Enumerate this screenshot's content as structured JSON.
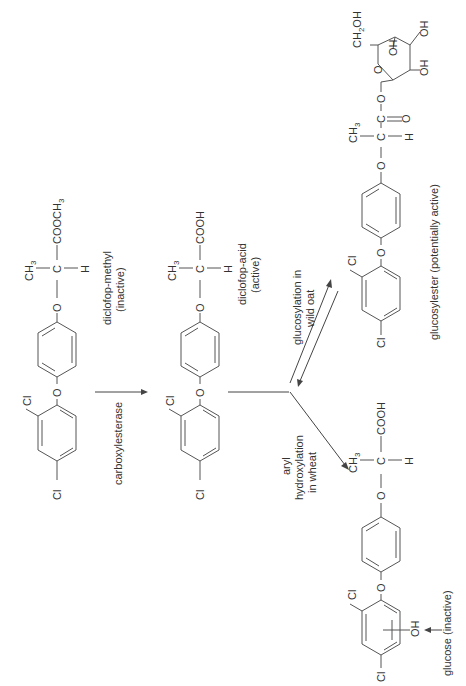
{
  "diagram": {
    "orientation": "rotated-90-ccw",
    "compounds": [
      {
        "id": "diclofop-methyl",
        "name": "diclofop-methyl",
        "activity": "(inactive)",
        "substituents": {
          "cl_a": "Cl",
          "cl_b": "Cl",
          "ether_o1": "O",
          "ether_o2": "O",
          "center_c": "C",
          "methyl": "CH3",
          "h": "H",
          "ester": "COOCH3"
        }
      },
      {
        "id": "diclofop-acid",
        "name": "diclofop-acid",
        "activity": "(active)",
        "substituents": {
          "cl_a": "Cl",
          "cl_b": "Cl",
          "ether_o1": "O",
          "ether_o2": "O",
          "center_c": "C",
          "methyl": "CH3",
          "h": "H",
          "acid": "COOH"
        }
      },
      {
        "id": "aryl-hydroxylated",
        "name": "glucose (inactive)",
        "substituents": {
          "cl_a": "Cl",
          "cl_b": "Cl",
          "oh": "OH",
          "ether_o1": "O",
          "ether_o2": "O",
          "center_c": "C",
          "methyl": "CH3",
          "h": "H",
          "acid": "COOH"
        }
      },
      {
        "id": "glucosylester",
        "name": "glucosylester (potentially active)",
        "substituents": {
          "cl_a": "Cl",
          "cl_b": "Cl",
          "ether_o1": "O",
          "ether_o2": "O",
          "center_c": "C",
          "methyl": "CH3",
          "h": "H",
          "carbonyl_c": "C",
          "carbonyl_o": "O",
          "ester_o": "O",
          "ring_o": "O",
          "ch2oh": "CH2OH",
          "oh1": "OH",
          "oh2": "OH",
          "oh3": "OH"
        }
      }
    ],
    "reactions": [
      {
        "label": "carboxylesterase",
        "from": "diclofop-methyl",
        "to": "diclofop-acid"
      },
      {
        "label_line1": "glucosylation in",
        "label_line2": "wild oat",
        "from": "diclofop-acid",
        "to": "glucosylester",
        "reversible": true
      },
      {
        "label_line1": "aryl",
        "label_line2": "hydroxylation",
        "label_line3": "in wheat",
        "from": "diclofop-acid",
        "to": "aryl-hydroxylated"
      }
    ]
  }
}
